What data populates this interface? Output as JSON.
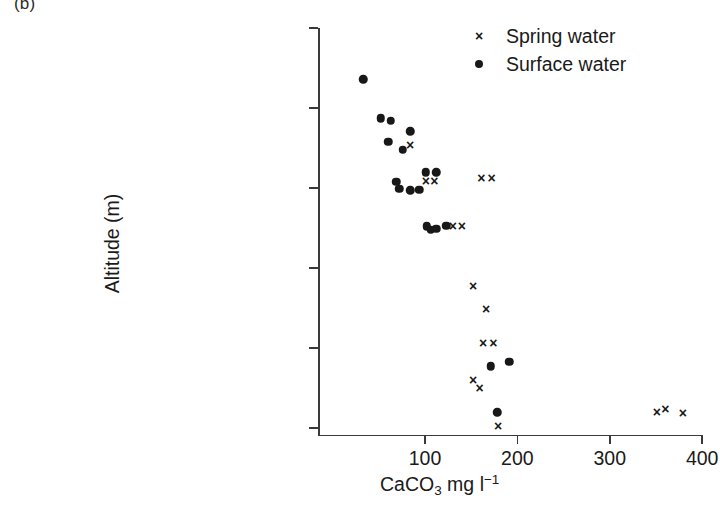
{
  "panel": {
    "label": "(b)"
  },
  "axes": {
    "y_title": "Altitude (m)",
    "x_title_html": "CaCO3 mg l-1",
    "x_title_parts": {
      "base": "CaCO",
      "sub": "3",
      "mid": " mg l",
      "sup": "−1"
    },
    "y_ticks": [
      "5000",
      "4500",
      "4000",
      "3500",
      "3000",
      "2500"
    ],
    "x_ticks": [
      "100",
      "200",
      "300",
      "400"
    ]
  },
  "legend": {
    "position": "top-right",
    "items": [
      {
        "marker": "cross-marker-icon",
        "label": "Spring water"
      },
      {
        "marker": "dot-marker-icon",
        "label": "Surface water"
      }
    ]
  },
  "colors": {
    "marker": "#181818",
    "axis": "#3a3a3a",
    "background": "#ffffff"
  },
  "chart_data": {
    "type": "scatter",
    "title": "",
    "xlabel": "CaCO3 mg l-1",
    "ylabel": "Altitude (m)",
    "xlim": [
      0,
      420
    ],
    "ylim": [
      2400,
      5000
    ],
    "grid": false,
    "legend_position": "top-right",
    "series": [
      {
        "name": "Surface water",
        "marker": "dot",
        "points": [
          {
            "x": 33,
            "y": 4680
          },
          {
            "x": 52,
            "y": 4435
          },
          {
            "x": 63,
            "y": 4420
          },
          {
            "x": 60,
            "y": 4290
          },
          {
            "x": 84,
            "y": 4355
          },
          {
            "x": 76,
            "y": 4240
          },
          {
            "x": 69,
            "y": 4040
          },
          {
            "x": 72,
            "y": 3995
          },
          {
            "x": 84,
            "y": 3985
          },
          {
            "x": 94,
            "y": 3990
          },
          {
            "x": 101,
            "y": 4100
          },
          {
            "x": 112,
            "y": 4100
          },
          {
            "x": 102,
            "y": 3760
          },
          {
            "x": 106,
            "y": 3740
          },
          {
            "x": 112,
            "y": 3745
          },
          {
            "x": 123,
            "y": 3765
          },
          {
            "x": 171,
            "y": 2885
          },
          {
            "x": 191,
            "y": 2915
          },
          {
            "x": 178,
            "y": 2600
          }
        ]
      },
      {
        "name": "Spring water",
        "marker": "cross",
        "points": [
          {
            "x": 84,
            "y": 4270
          },
          {
            "x": 101,
            "y": 4045
          },
          {
            "x": 110,
            "y": 4045
          },
          {
            "x": 161,
            "y": 4065
          },
          {
            "x": 172,
            "y": 4065
          },
          {
            "x": 130,
            "y": 3760
          },
          {
            "x": 140,
            "y": 3760
          },
          {
            "x": 152,
            "y": 3390
          },
          {
            "x": 166,
            "y": 3245
          },
          {
            "x": 163,
            "y": 3030
          },
          {
            "x": 174,
            "y": 3030
          },
          {
            "x": 152,
            "y": 2800
          },
          {
            "x": 159,
            "y": 2750
          },
          {
            "x": 179,
            "y": 2515
          },
          {
            "x": 351,
            "y": 2600
          },
          {
            "x": 360,
            "y": 2620
          },
          {
            "x": 379,
            "y": 2595
          }
        ]
      }
    ]
  }
}
